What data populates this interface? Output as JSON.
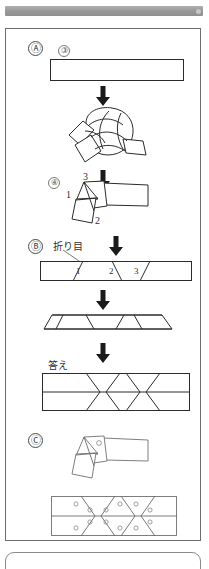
{
  "page": {
    "background_color": "#ffffff",
    "border_color": "#6e6e6e"
  },
  "top_bar": {
    "name": "scan-artifact-bar",
    "color": "#9a9a9a"
  },
  "sections": [
    {
      "id": "A",
      "letter": "Ⓐ",
      "steps": [
        {
          "number": "③",
          "figure": "flat-paper-strip",
          "caption": ""
        },
        {
          "number": "",
          "figure": "tied-knot",
          "caption": ""
        },
        {
          "number": "④",
          "figure": "folded-knot-opened",
          "caption": "",
          "vertex_labels": [
            "1",
            "2",
            "3"
          ]
        }
      ]
    },
    {
      "id": "B",
      "letter": "Ⓑ",
      "fold_label": "折り目",
      "answer_label": "答え",
      "strip_fold_numbers": [
        "1",
        "2",
        "3"
      ],
      "figures": [
        "strip-with-fold-lines",
        "flattened-zigzag-strip",
        "answer-strip-with-creases"
      ]
    },
    {
      "id": "C",
      "letter": "Ⓒ",
      "figures": [
        "folded-knot-with-marks",
        "unfolded-strip-with-marks"
      ]
    }
  ],
  "arrows": [
    {
      "name": "down-arrow-1",
      "direction": "down"
    },
    {
      "name": "down-arrow-2",
      "direction": "down"
    },
    {
      "name": "down-arrow-3",
      "direction": "down"
    },
    {
      "name": "down-arrow-4",
      "direction": "down"
    },
    {
      "name": "down-arrow-5",
      "direction": "down"
    }
  ],
  "colors": {
    "ink": "#2b2b2b",
    "light_ink": "#6a6a6a",
    "paper": "#ffffff",
    "bar": "#9a9a9a"
  }
}
